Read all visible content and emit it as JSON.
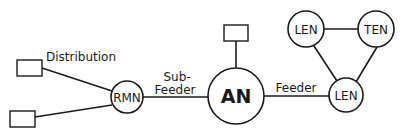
{
  "diagram": {
    "title": "",
    "nodes": [
      {
        "id": "rmn",
        "label": "RMN",
        "type": "circle"
      },
      {
        "id": "an",
        "label": "AN",
        "type": "circle"
      },
      {
        "id": "len_bottom",
        "label": "LEN",
        "type": "circle"
      },
      {
        "id": "len_top",
        "label": "LEN",
        "type": "circle"
      },
      {
        "id": "ten",
        "label": "TEN",
        "type": "circle"
      },
      {
        "id": "box_dist_top",
        "label": "",
        "type": "rectangle"
      },
      {
        "id": "box_dist_bottom",
        "label": "",
        "type": "rectangle"
      },
      {
        "id": "box_an_top",
        "label": "",
        "type": "rectangle"
      }
    ],
    "edges": [
      {
        "from": "box_dist_top",
        "to": "rmn",
        "label": "Distribution"
      },
      {
        "from": "box_dist_bottom",
        "to": "rmn",
        "label": ""
      },
      {
        "from": "rmn",
        "to": "an",
        "label": "Sub-Feeder"
      },
      {
        "from": "box_an_top",
        "to": "an",
        "label": ""
      },
      {
        "from": "an",
        "to": "len_bottom",
        "label": "Feeder"
      },
      {
        "from": "len_bottom",
        "to": "len_top",
        "label": ""
      },
      {
        "from": "len_bottom",
        "to": "ten",
        "label": ""
      },
      {
        "from": "len_top",
        "to": "ten",
        "label": ""
      }
    ],
    "labels": {
      "distribution": "Distribution",
      "sub_line1": "Sub-",
      "sub_line2": "Feeder",
      "feeder": "Feeder",
      "rmn": "RMN",
      "an": "AN",
      "len_bottom": "LEN",
      "len_top": "LEN",
      "ten": "TEN"
    },
    "colors": {
      "stroke": "#1a1a1a",
      "background": "#ffffff"
    }
  }
}
